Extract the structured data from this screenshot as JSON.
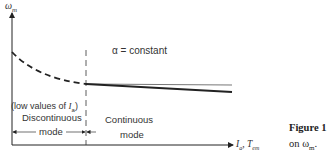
{
  "y_axis_label": "ω",
  "y_axis_sub": "m",
  "x_axis_label": "I",
  "x_axis_sub_a": "a",
  "x_axis_label2": ", T",
  "x_axis_sub_em": "em",
  "annotation": "α = constant",
  "low_values_label_pre": "(low values of ",
  "low_values_label_var": "I",
  "low_values_label_sub": "a",
  "low_values_label_post": ")",
  "discontinuous_label": "Discontinuous",
  "discontinuous_mode": "mode",
  "continuous_label": "Continuous",
  "continuous_mode": "mode",
  "caption_title": "Figure 1",
  "caption_text": "on ω",
  "caption_sub": "m",
  "caption_end": ".",
  "colors": {
    "line": "#222222",
    "thin_line": "#555555"
  }
}
